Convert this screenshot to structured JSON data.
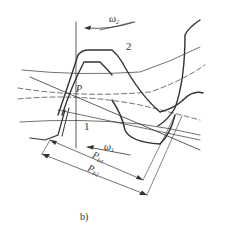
{
  "figure": {
    "caption": "b)",
    "labels": {
      "omega2": {
        "symbol": "ω",
        "sub": "2"
      },
      "omega1": {
        "symbol": "ω",
        "sub": "1"
      },
      "gear2": "2",
      "gear1": "1",
      "pitch_point": "P",
      "pb1": {
        "symbol": "P",
        "sub": "b1"
      },
      "pb2": {
        "symbol": "P",
        "sub": "b2"
      }
    },
    "colors": {
      "stroke": "#333333",
      "background": "#ffffff"
    }
  }
}
